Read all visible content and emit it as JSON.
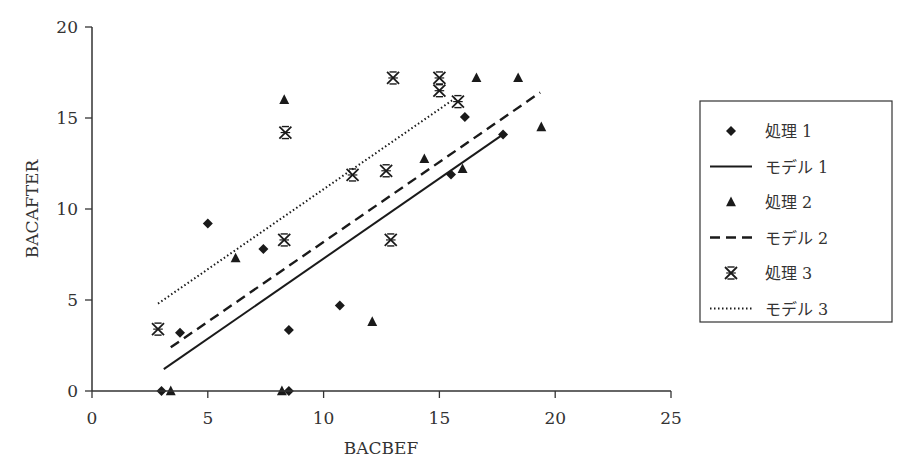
{
  "chart_data": {
    "type": "scatter",
    "title": "",
    "xlabel": "BACBEF",
    "ylabel": "BACAFTER",
    "xlim": [
      0,
      25
    ],
    "ylim": [
      0,
      20
    ],
    "xticks": [
      0,
      5,
      10,
      15,
      20,
      25
    ],
    "yticks": [
      0,
      5,
      10,
      15,
      20
    ],
    "grid": false,
    "legend_position": "right",
    "series": [
      {
        "name": "処理1",
        "kind": "points",
        "marker": "diamond",
        "points": [
          [
            3.0,
            0.0
          ],
          [
            3.8,
            3.2
          ],
          [
            5.0,
            9.2
          ],
          [
            7.4,
            7.8
          ],
          [
            8.5,
            3.35
          ],
          [
            8.5,
            0.0
          ],
          [
            10.7,
            4.7
          ],
          [
            15.5,
            11.9
          ],
          [
            16.1,
            15.05
          ],
          [
            17.75,
            14.1
          ]
        ]
      },
      {
        "name": "モデル1",
        "kind": "line",
        "style": "solid",
        "points": [
          [
            3.1,
            1.2
          ],
          [
            17.75,
            14.1
          ]
        ]
      },
      {
        "name": "処理2",
        "kind": "points",
        "marker": "triangle",
        "points": [
          [
            3.4,
            0.0
          ],
          [
            6.2,
            7.3
          ],
          [
            8.2,
            0.0
          ],
          [
            8.3,
            16.0
          ],
          [
            12.1,
            3.8
          ],
          [
            14.35,
            12.75
          ],
          [
            16.0,
            12.2
          ],
          [
            16.6,
            17.2
          ],
          [
            18.4,
            17.2
          ],
          [
            19.4,
            14.5
          ]
        ]
      },
      {
        "name": "モデル2",
        "kind": "line",
        "style": "dashed",
        "points": [
          [
            3.4,
            2.4
          ],
          [
            19.35,
            16.4
          ]
        ]
      },
      {
        "name": "処理3",
        "kind": "points",
        "marker": "asterisk",
        "points": [
          [
            2.85,
            3.4
          ],
          [
            8.3,
            8.3
          ],
          [
            8.35,
            14.2
          ],
          [
            11.25,
            11.87
          ],
          [
            12.7,
            12.1
          ],
          [
            12.9,
            8.3
          ],
          [
            13.0,
            17.2
          ],
          [
            15.0,
            17.2
          ],
          [
            15.0,
            16.5
          ],
          [
            15.8,
            15.9
          ]
        ]
      },
      {
        "name": "モデル3",
        "kind": "line",
        "style": "dotted",
        "points": [
          [
            2.85,
            4.8
          ],
          [
            15.7,
            16.1
          ]
        ]
      }
    ]
  },
  "legend": {
    "items": [
      {
        "label": "処理 1",
        "symbol": "diamond-icon"
      },
      {
        "label": "モデル 1",
        "symbol": "solid-line-icon"
      },
      {
        "label": "処理 2",
        "symbol": "triangle-icon"
      },
      {
        "label": "モデル 2",
        "symbol": "dashed-line-icon"
      },
      {
        "label": "処理 3",
        "symbol": "asterisk-icon"
      },
      {
        "label": "モデル 3",
        "symbol": "dotted-line-icon"
      }
    ]
  },
  "axes": {
    "x_label": "BACBEF",
    "y_label": "BACAFTER",
    "x_ticks": [
      "0",
      "5",
      "10",
      "15",
      "20",
      "25"
    ],
    "y_ticks": [
      "0",
      "5",
      "10",
      "15",
      "20"
    ]
  },
  "colors": {
    "ink": "#1a1a1a",
    "axis": "#333333",
    "background": "#ffffff"
  }
}
